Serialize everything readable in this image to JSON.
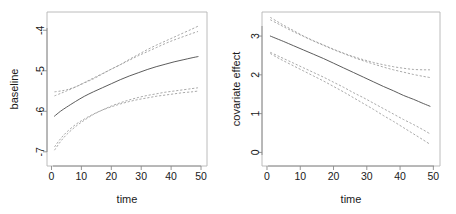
{
  "figure": {
    "title": "",
    "panel_count": 2,
    "background_color": "#ffffff",
    "solid_curve_color": "#4a4a4a",
    "dashed_curve_color": "#9a9a9a",
    "axis_color": "#8a8a8a"
  },
  "chart_data": [
    {
      "type": "line",
      "panel": "left",
      "title": "",
      "xlabel": "time",
      "ylabel": "baseline",
      "xlim": [
        -1.5,
        52
      ],
      "ylim": [
        -7.35,
        -3.55
      ],
      "xticks": [
        0,
        10,
        20,
        30,
        40,
        50
      ],
      "xtick_labels": [
        "0",
        "10",
        "20",
        "30",
        "40",
        "50"
      ],
      "yticks": [
        -7,
        -6,
        -5,
        -4
      ],
      "ytick_labels": [
        "-7",
        "-6",
        "-5",
        "-4"
      ],
      "grid": false,
      "legend": "none",
      "x": [
        1,
        3,
        5,
        8,
        11,
        14,
        17,
        20,
        23,
        26,
        29,
        32,
        35,
        38,
        41,
        44,
        47,
        49
      ],
      "series": [
        {
          "name": "estimate",
          "style": "solid",
          "values": [
            -6.12,
            -6.0,
            -5.9,
            -5.76,
            -5.63,
            -5.52,
            -5.42,
            -5.32,
            -5.22,
            -5.13,
            -5.05,
            -4.97,
            -4.9,
            -4.84,
            -4.78,
            -4.73,
            -4.68,
            -4.65
          ]
        },
        {
          "name": "upper-band-a",
          "style": "dashed",
          "values": [
            -5.52,
            -5.5,
            -5.47,
            -5.4,
            -5.3,
            -5.2,
            -5.08,
            -4.96,
            -4.85,
            -4.72,
            -4.6,
            -4.48,
            -4.37,
            -4.27,
            -4.17,
            -4.07,
            -3.97,
            -3.9
          ]
        },
        {
          "name": "upper-band-b",
          "style": "dashed",
          "values": [
            -5.62,
            -5.56,
            -5.5,
            -5.4,
            -5.29,
            -5.18,
            -5.07,
            -4.96,
            -4.85,
            -4.74,
            -4.63,
            -4.53,
            -4.43,
            -4.33,
            -4.24,
            -4.16,
            -4.08,
            -4.03
          ]
        },
        {
          "name": "lower-band-a",
          "style": "dashed",
          "values": [
            -6.96,
            -6.75,
            -6.58,
            -6.38,
            -6.22,
            -6.08,
            -5.97,
            -5.87,
            -5.79,
            -5.72,
            -5.66,
            -5.61,
            -5.57,
            -5.53,
            -5.5,
            -5.47,
            -5.44,
            -5.42
          ]
        },
        {
          "name": "lower-band-b",
          "style": "dashed",
          "values": [
            -6.88,
            -6.68,
            -6.52,
            -6.33,
            -6.19,
            -6.07,
            -5.97,
            -5.89,
            -5.82,
            -5.76,
            -5.71,
            -5.67,
            -5.63,
            -5.6,
            -5.57,
            -5.54,
            -5.52,
            -5.5
          ]
        }
      ]
    },
    {
      "type": "line",
      "panel": "right",
      "title": "",
      "xlabel": "time",
      "ylabel": "covariate effect",
      "xlim": [
        -1.5,
        52
      ],
      "ylim": [
        -0.35,
        3.62
      ],
      "xticks": [
        0,
        10,
        20,
        30,
        40,
        50
      ],
      "xtick_labels": [
        "0",
        "10",
        "20",
        "30",
        "40",
        "50"
      ],
      "yticks": [
        0,
        1,
        2,
        3
      ],
      "ytick_labels": [
        "0",
        "1",
        "2",
        "3"
      ],
      "grid": false,
      "legend": "none",
      "x": [
        1,
        3,
        5,
        8,
        11,
        14,
        17,
        20,
        23,
        26,
        29,
        32,
        35,
        38,
        41,
        44,
        47,
        49
      ],
      "series": [
        {
          "name": "estimate",
          "style": "solid",
          "values": [
            3.0,
            2.93,
            2.86,
            2.75,
            2.64,
            2.53,
            2.42,
            2.3,
            2.18,
            2.06,
            1.94,
            1.82,
            1.7,
            1.59,
            1.47,
            1.37,
            1.26,
            1.19
          ]
        },
        {
          "name": "upper-band-a",
          "style": "dashed",
          "values": [
            3.48,
            3.38,
            3.28,
            3.14,
            3.0,
            2.88,
            2.77,
            2.66,
            2.56,
            2.47,
            2.39,
            2.32,
            2.26,
            2.21,
            2.17,
            2.14,
            2.13,
            2.13
          ]
        },
        {
          "name": "upper-band-b",
          "style": "dashed",
          "values": [
            3.42,
            3.33,
            3.24,
            3.11,
            2.99,
            2.87,
            2.76,
            2.65,
            2.55,
            2.45,
            2.36,
            2.28,
            2.2,
            2.13,
            2.07,
            2.01,
            1.96,
            1.93
          ]
        },
        {
          "name": "lower-band-a",
          "style": "dashed",
          "values": [
            2.58,
            2.5,
            2.42,
            2.3,
            2.18,
            2.06,
            1.94,
            1.81,
            1.68,
            1.54,
            1.41,
            1.27,
            1.13,
            0.99,
            0.85,
            0.72,
            0.58,
            0.48
          ]
        },
        {
          "name": "lower-band-b",
          "style": "dashed",
          "values": [
            2.55,
            2.45,
            2.36,
            2.23,
            2.1,
            1.97,
            1.84,
            1.7,
            1.56,
            1.41,
            1.26,
            1.11,
            0.95,
            0.8,
            0.64,
            0.48,
            0.32,
            0.21
          ]
        }
      ]
    }
  ]
}
